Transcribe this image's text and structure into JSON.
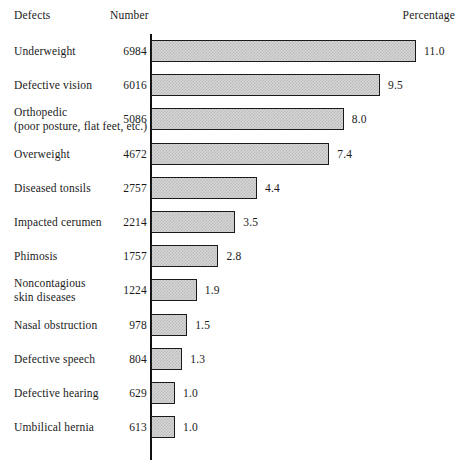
{
  "header": {
    "col_defects": "Defects",
    "col_number": "Number",
    "col_percentage": "Percentage"
  },
  "chart_data": {
    "type": "bar",
    "orientation": "horizontal",
    "title": "",
    "subtitle": "",
    "xlabel": "Percentage",
    "ylabel": "Defects",
    "grid": false,
    "legend": null,
    "xlim": [
      0,
      11.0
    ],
    "value_precision": 1,
    "categories": [
      "Underweight",
      "Defective vision",
      "Orthopedic (poor posture, flat feet, etc.)",
      "Overweight",
      "Diseased tonsils",
      "Impacted cerumen",
      "Phimosis",
      "Noncontagious skin diseases",
      "Nasal obstruction",
      "Defective speech",
      "Defective hearing",
      "Umbilical hernia"
    ],
    "values": [
      11.0,
      9.5,
      8.0,
      7.4,
      4.4,
      3.5,
      2.8,
      1.9,
      1.5,
      1.3,
      1.0,
      1.0
    ],
    "counts": [
      6984,
      6016,
      5086,
      4672,
      2757,
      2214,
      1757,
      1224,
      978,
      804,
      629,
      613
    ]
  },
  "rows": [
    {
      "label_line1": "Underweight",
      "label_line2": "",
      "number": "6984",
      "percent": "11.0",
      "value": 11.0
    },
    {
      "label_line1": "Defective vision",
      "label_line2": "",
      "number": "6016",
      "percent": "9.5",
      "value": 9.5
    },
    {
      "label_line1": "Orthopedic",
      "label_line2": "(poor posture, flat feet, etc.)",
      "number": "5086",
      "percent": "8.0",
      "value": 8.0
    },
    {
      "label_line1": "Overweight",
      "label_line2": "",
      "number": "4672",
      "percent": "7.4",
      "value": 7.4
    },
    {
      "label_line1": "Diseased tonsils",
      "label_line2": "",
      "number": "2757",
      "percent": "4.4",
      "value": 4.4
    },
    {
      "label_line1": "Impacted cerumen",
      "label_line2": "",
      "number": "2214",
      "percent": "3.5",
      "value": 3.5
    },
    {
      "label_line1": "Phimosis",
      "label_line2": "",
      "number": "1757",
      "percent": "2.8",
      "value": 2.8
    },
    {
      "label_line1": "Noncontagious",
      "label_line2": "skin diseases",
      "number": "1224",
      "percent": "1.9",
      "value": 1.9
    },
    {
      "label_line1": "Nasal obstruction",
      "label_line2": "",
      "number": "978",
      "percent": "1.5",
      "value": 1.5
    },
    {
      "label_line1": "Defective speech",
      "label_line2": "",
      "number": "804",
      "percent": "1.3",
      "value": 1.3
    },
    {
      "label_line1": "Defective hearing",
      "label_line2": "",
      "number": "629",
      "percent": "1.0",
      "value": 1.0
    },
    {
      "label_line1": "Umbilical hernia",
      "label_line2": "",
      "number": "613",
      "percent": "1.0",
      "value": 1.0
    }
  ],
  "layout": {
    "axis_x": 151,
    "row_pitch": 34.2,
    "first_row_top": 4,
    "px_per_percent": 24.1,
    "bar_height": 22
  },
  "colors": {
    "ink": "#1a1a1a",
    "bar_fill": "#d6d6d6",
    "bar_stipple": "#b9b9b9",
    "background": "#ffffff"
  }
}
